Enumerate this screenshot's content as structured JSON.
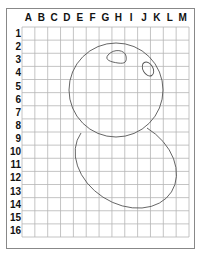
{
  "grid": {
    "columns": [
      "A",
      "B",
      "C",
      "D",
      "E",
      "F",
      "G",
      "H",
      "I",
      "J",
      "K",
      "L",
      "M"
    ],
    "rows": [
      "1",
      "2",
      "3",
      "4",
      "5",
      "6",
      "7",
      "8",
      "9",
      "10",
      "11",
      "12",
      "13",
      "14",
      "15",
      "16"
    ]
  },
  "drawing": {
    "description": "Grid drawing of a snowman-like figure: circle head with two oval eyes above a tilted oval body",
    "shapes": [
      "head-circle",
      "eye-left",
      "eye-right",
      "body-ellipse"
    ]
  },
  "colors": {
    "grid_line": "#b5b5b5",
    "shape_line": "#555555",
    "label": "#111111",
    "border": "#888888"
  }
}
